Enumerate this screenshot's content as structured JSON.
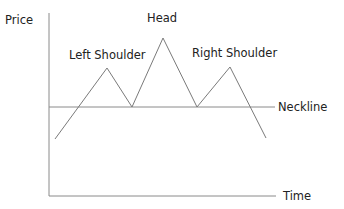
{
  "chart_data": {
    "type": "line",
    "xlabel": "Time",
    "ylabel": "Price",
    "series": [
      {
        "name": "price-path",
        "points": [
          {
            "x": 55,
            "y": 139
          },
          {
            "x": 107,
            "y": 68
          },
          {
            "x": 132,
            "y": 107
          },
          {
            "x": 163,
            "y": 38
          },
          {
            "x": 197,
            "y": 107
          },
          {
            "x": 230,
            "y": 67
          },
          {
            "x": 266,
            "y": 138
          }
        ]
      }
    ],
    "neckline": {
      "label": "Neckline",
      "y": 107
    },
    "annotations": [
      {
        "text": "Left Shoulder",
        "target": "peak-1"
      },
      {
        "text": "Head",
        "target": "peak-2"
      },
      {
        "text": "Right Shoulder",
        "target": "peak-3"
      },
      {
        "text": "Neckline",
        "target": "neckline"
      }
    ],
    "grid": false,
    "legend": null
  },
  "labels": {
    "y_axis": "Price",
    "x_axis": "Time",
    "head": "Head",
    "left_shoulder": "Left Shoulder",
    "right_shoulder": "Right Shoulder",
    "neckline": "Neckline"
  },
  "colors": {
    "line": "#7a7a7a",
    "axis": "#8a8a8a",
    "text": "#222222"
  }
}
